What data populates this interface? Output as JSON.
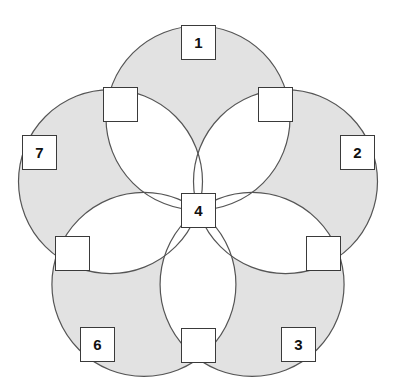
{
  "figure": {
    "canvas": {
      "width": 398,
      "height": 387
    },
    "colors": {
      "background": "#ffffff",
      "region_fill": "#e2e2e2",
      "region_stroke": "#555555",
      "box_fill": "#ffffff",
      "box_stroke": "#3a3a3a",
      "label_color": "#111111"
    },
    "geometry": {
      "center_x": 198,
      "center_y": 210,
      "circle_radius": 92,
      "petal_count": 5,
      "circle_centers_radius": 92,
      "first_circle_angle_deg": -90
    }
  },
  "nodes": [
    {
      "id": "n1",
      "label": "1",
      "name": "node-box-1",
      "x": 181,
      "y": 25,
      "w": 35,
      "h": 35,
      "labeled": true
    },
    {
      "id": "n2",
      "label": "2",
      "name": "node-box-2",
      "x": 340,
      "y": 135,
      "w": 35,
      "h": 35,
      "labeled": true
    },
    {
      "id": "n3",
      "label": "3",
      "name": "node-box-3",
      "x": 281,
      "y": 327,
      "w": 35,
      "h": 35,
      "labeled": true
    },
    {
      "id": "n6",
      "label": "6",
      "name": "node-box-6",
      "x": 80,
      "y": 327,
      "w": 35,
      "h": 35,
      "labeled": true
    },
    {
      "id": "n7",
      "label": "7",
      "name": "node-box-7",
      "x": 22,
      "y": 135,
      "w": 35,
      "h": 35,
      "labeled": true
    },
    {
      "id": "n4",
      "label": "4",
      "name": "node-box-4-center",
      "x": 181,
      "y": 193,
      "w": 35,
      "h": 35,
      "labeled": true
    },
    {
      "id": "u1",
      "label": "",
      "name": "node-box-blank-top-left",
      "x": 103,
      "y": 87,
      "w": 35,
      "h": 35,
      "labeled": false
    },
    {
      "id": "u2",
      "label": "",
      "name": "node-box-blank-top-right",
      "x": 258,
      "y": 87,
      "w": 35,
      "h": 35,
      "labeled": false
    },
    {
      "id": "u3",
      "label": "",
      "name": "node-box-blank-mid-right",
      "x": 306,
      "y": 236,
      "w": 35,
      "h": 35,
      "labeled": false
    },
    {
      "id": "u4",
      "label": "",
      "name": "node-box-blank-bottom",
      "x": 181,
      "y": 328,
      "w": 35,
      "h": 35,
      "labeled": false
    },
    {
      "id": "u5",
      "label": "",
      "name": "node-box-blank-mid-left",
      "x": 55,
      "y": 236,
      "w": 35,
      "h": 35,
      "labeled": false
    }
  ]
}
